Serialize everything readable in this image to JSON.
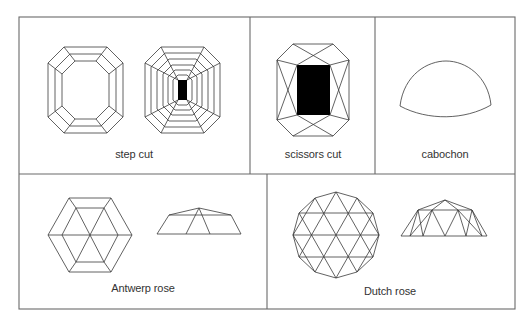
{
  "figure": {
    "panels": [
      {
        "id": "step-cut",
        "label": "step cut",
        "views": [
          "emerald step cut top view",
          "multi-step cut top view"
        ]
      },
      {
        "id": "scissors-cut",
        "label": "scissors cut",
        "views": [
          "top view"
        ]
      },
      {
        "id": "cabochon",
        "label": "cabochon",
        "views": [
          "profile view"
        ]
      },
      {
        "id": "antwerp-rose",
        "label": "Antwerp rose",
        "views": [
          "hexagonal top view",
          "profile view"
        ]
      },
      {
        "id": "dutch-rose",
        "label": "Dutch rose",
        "views": [
          "round top view",
          "profile view"
        ]
      }
    ]
  },
  "colors": {
    "line": "#3a3a3a",
    "border": "#6a6a6a",
    "background": "#ffffff"
  }
}
